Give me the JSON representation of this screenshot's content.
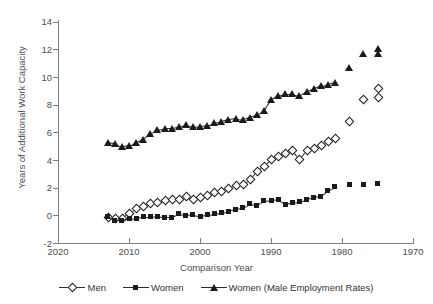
{
  "chart_data": {
    "type": "scatter",
    "title": "",
    "xlabel": "Comparison Year",
    "ylabel": "Years of Additional Work Capacity",
    "xlim": [
      2020,
      1970
    ],
    "ylim": [
      -2,
      14
    ],
    "x_reversed": true,
    "grid": false,
    "legend_position": "bottom",
    "xticks": [
      2020,
      2010,
      2000,
      1990,
      1980,
      1970
    ],
    "yticks": [
      -2,
      0,
      2,
      4,
      6,
      8,
      10,
      12,
      14
    ],
    "series": [
      {
        "name": "Men",
        "marker": "open-diamond",
        "x": [
          2013,
          2012,
          2011,
          2010,
          2009,
          2008,
          2007,
          2006,
          2005,
          2004,
          2003,
          2002,
          2001,
          2000,
          1999,
          1998,
          1997,
          1996,
          1995,
          1994,
          1993,
          1992,
          1991,
          1990,
          1989,
          1988,
          1987,
          1986,
          1985,
          1984,
          1983,
          1982,
          1981,
          1979,
          1977,
          1975
        ],
        "y": [
          -0.1,
          -0.2,
          -0.2,
          0.2,
          0.5,
          0.7,
          0.9,
          1.0,
          1.1,
          1.2,
          1.2,
          1.4,
          1.2,
          1.3,
          1.5,
          1.7,
          1.8,
          2.0,
          2.2,
          2.3,
          2.6,
          3.2,
          3.6,
          4.1,
          4.3,
          4.5,
          4.7,
          4.1,
          4.7,
          4.9,
          5.1,
          5.4,
          5.6,
          6.8,
          8.4,
          8.6
        ],
        "y_last": 9.2
      },
      {
        "name": "Women",
        "marker": "filled-square",
        "x": [
          2013,
          2012,
          2011,
          2010,
          2009,
          2008,
          2007,
          2006,
          2005,
          2004,
          2003,
          2002,
          2001,
          2000,
          1999,
          1998,
          1997,
          1996,
          1995,
          1994,
          1993,
          1992,
          1991,
          1990,
          1989,
          1988,
          1987,
          1986,
          1985,
          1984,
          1983,
          1982,
          1981,
          1979,
          1977,
          1975
        ],
        "y": [
          -0.05,
          -0.35,
          -0.35,
          -0.25,
          -0.2,
          -0.1,
          -0.1,
          -0.05,
          -0.15,
          -0.15,
          0.1,
          0.0,
          0.05,
          -0.05,
          0.05,
          0.1,
          0.2,
          0.3,
          0.45,
          0.55,
          0.85,
          0.75,
          1.05,
          1.1,
          1.15,
          0.8,
          0.9,
          1.0,
          1.15,
          1.3,
          1.4,
          1.8,
          2.1,
          2.2,
          2.25,
          2.3
        ],
        "y_last": 2.3
      },
      {
        "name": "Women (Male Employment Rates)",
        "marker": "filled-triangle",
        "x": [
          2013,
          2012,
          2011,
          2010,
          2009,
          2008,
          2007,
          2006,
          2005,
          2004,
          2003,
          2002,
          2001,
          2000,
          1999,
          1998,
          1997,
          1996,
          1995,
          1994,
          1993,
          1992,
          1991,
          1990,
          1989,
          1988,
          1987,
          1986,
          1985,
          1984,
          1983,
          1982,
          1981,
          1979,
          1977,
          1975
        ],
        "y": [
          5.3,
          5.2,
          5.0,
          5.05,
          5.3,
          5.5,
          5.9,
          6.2,
          6.3,
          6.3,
          6.4,
          6.55,
          6.4,
          6.45,
          6.5,
          6.7,
          6.8,
          6.95,
          7.0,
          6.95,
          7.1,
          7.3,
          7.6,
          8.4,
          8.65,
          8.8,
          8.8,
          8.65,
          9.0,
          9.2,
          9.4,
          9.5,
          9.65,
          10.7,
          11.7,
          11.75
        ],
        "y_last": 12.05
      }
    ]
  },
  "axis": {
    "y_title": "Years of Additional Work Capacity",
    "x_title": "Comparison Year",
    "y_tick_labels": [
      "14",
      "12",
      "10",
      "8",
      "6",
      "4",
      "2",
      "0",
      "-2"
    ],
    "x_tick_labels": [
      "2020",
      "2010",
      "2000",
      "1990",
      "1980",
      "1970"
    ]
  },
  "legend": {
    "items": [
      {
        "label": "Men",
        "marker": "open-diamond-icon"
      },
      {
        "label": "Women",
        "marker": "filled-square-icon"
      },
      {
        "label": "Women (Male Employment Rates)",
        "marker": "filled-triangle-icon"
      }
    ]
  },
  "colors": {
    "marker_fill": "#1a1a1a",
    "marker_open_fill": "#ffffff",
    "axis": "#808080",
    "text": "#4d4d4d",
    "background": "#ffffff"
  }
}
